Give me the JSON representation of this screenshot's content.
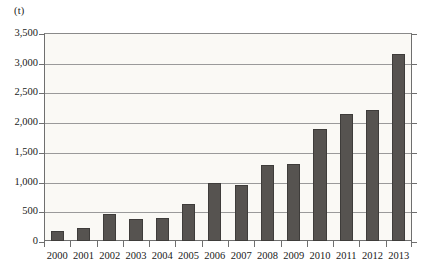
{
  "chart_data": {
    "type": "bar",
    "title": "",
    "subtitle": "",
    "xlabel": "",
    "ylabel": "(t)",
    "unit_label": "(t)",
    "categories": [
      "2000",
      "2001",
      "2002",
      "2003",
      "2004",
      "2005",
      "2006",
      "2007",
      "2008",
      "2009",
      "2010",
      "2011",
      "2012",
      "2013"
    ],
    "values": [
      170,
      215,
      455,
      375,
      395,
      620,
      970,
      940,
      1280,
      1300,
      1890,
      2130,
      2200,
      3140
    ],
    "ylim": [
      0,
      3500
    ],
    "ytick_values": [
      0,
      500,
      1000,
      1500,
      2000,
      2500,
      3000,
      3500
    ],
    "ytick_labels": [
      "0",
      "500",
      "1,000",
      "1,500",
      "2,000",
      "2,500",
      "3,000",
      "3,500"
    ],
    "grid": true,
    "grid_axis": "y",
    "legend": false,
    "legend_position": "none",
    "series": [
      {
        "name": "",
        "values": [
          170,
          215,
          455,
          375,
          395,
          620,
          970,
          940,
          1280,
          1300,
          1890,
          2130,
          2200,
          3140
        ]
      }
    ],
    "colors": {
      "bar": "#565350",
      "bar_border": "#3e3c3a",
      "plot_background": "#faf9f5",
      "axis": "#6f6f6f",
      "gridline": "#9a9a9a",
      "text": "#1a1a1a",
      "page_background": "#ffffff"
    }
  }
}
